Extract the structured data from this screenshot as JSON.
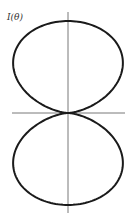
{
  "figure": {
    "ylabel": "I(θ)",
    "line_color": "#1a1a1a",
    "axis_color": "#555555"
  },
  "chart_data": {
    "type": "polar-line",
    "title": "",
    "ylabel": "I(θ)",
    "function": "cos^2(θ) lobes along vertical axis",
    "lobes": [
      "upper",
      "lower"
    ],
    "axes": [
      "horizontal",
      "vertical"
    ]
  }
}
